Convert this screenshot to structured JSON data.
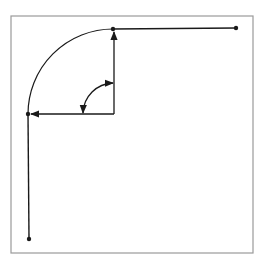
{
  "diagram": {
    "type": "fillet-corner-geometry",
    "colors": {
      "background": "#ffffff",
      "frame": "#9a9a9a",
      "stroke": "#1a1a1a"
    },
    "frame": {
      "x": 11,
      "y": 16,
      "width": 242,
      "height": 237
    },
    "points": {
      "top_end": {
        "x": 236,
        "y": 28
      },
      "arc_top": {
        "x": 113,
        "y": 29
      },
      "center": {
        "x": 114,
        "y": 114
      },
      "arc_left": {
        "x": 28,
        "y": 114
      },
      "bottom_end": {
        "x": 29,
        "y": 239
      }
    },
    "fillet_radius": 85,
    "angle_arc_radius": 31,
    "angle_degrees": 90
  }
}
